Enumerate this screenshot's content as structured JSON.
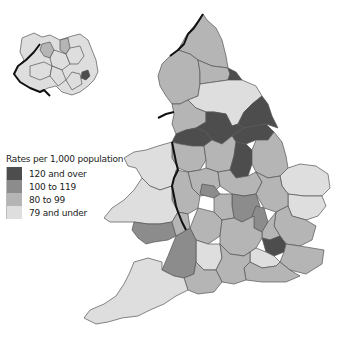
{
  "legend": {
    "title": "Rates per 1,000 population",
    "items": [
      {
        "label": "120 and over",
        "color": "#4d4d4d"
      },
      {
        "label": "100 to 119",
        "color": "#8c8c8c"
      },
      {
        "label": "80 to 99",
        "color": "#b5b5b5"
      },
      {
        "label": "79 and under",
        "color": "#dedede"
      }
    ]
  },
  "map": {
    "areas": [
      "Northern Ireland",
      "England",
      "Wales"
    ],
    "colors": {
      "c120": "#4d4d4d",
      "c100": "#8c8c8c",
      "c80": "#b5b5b5",
      "c79": "#dedede",
      "border": "#111111",
      "outline": "#555555"
    }
  }
}
